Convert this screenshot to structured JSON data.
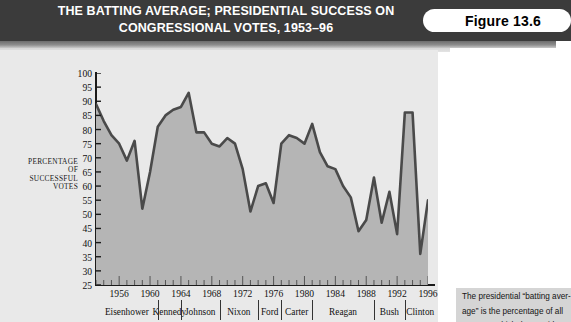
{
  "banner": {
    "title_line1": "THE BATTING AVERAGE; PRESIDENTIAL SUCCESS ON",
    "title_line2": "CONGRESSIONAL VOTES, 1953–96",
    "figure_label": "Figure 13.6",
    "background_color": "#3b3b3b",
    "text_color": "#ffffff"
  },
  "panel": {
    "background_color": "#e9e9e9"
  },
  "caption": {
    "line1": "The presidential “batting aver-",
    "line2": "age” is the percentage of all",
    "line3": "votes on which the president"
  },
  "axis": {
    "ylabel_line1": "PERCENTAGE",
    "ylabel_line2": "OF",
    "ylabel_line3": "SUCCESSFUL",
    "ylabel_line4": "VOTES"
  },
  "chart_data": {
    "type": "area",
    "title": "THE BATTING AVERAGE; PRESIDENTIAL SUCCESS ON CONGRESSIONAL VOTES, 1953–96",
    "xlabel": "",
    "ylabel": "PERCENTAGE OF SUCCESSFUL VOTES",
    "xlim": [
      1953,
      1996
    ],
    "ylim": [
      25,
      100
    ],
    "grid": false,
    "legend": "none",
    "line_color": "#4a4a4a",
    "fill_color": "#b5b5b5",
    "yticks": [
      100,
      95,
      90,
      85,
      80,
      75,
      70,
      65,
      60,
      55,
      50,
      45,
      40,
      35,
      30,
      25
    ],
    "xticks": [
      1956,
      1960,
      1964,
      1968,
      1972,
      1976,
      1980,
      1984,
      1988,
      1992,
      1996
    ],
    "xtick_minor_step": 1,
    "x": [
      1953,
      1954,
      1955,
      1956,
      1957,
      1958,
      1959,
      1960,
      1961,
      1962,
      1963,
      1964,
      1965,
      1966,
      1967,
      1968,
      1969,
      1970,
      1971,
      1972,
      1973,
      1974,
      1975,
      1976,
      1977,
      1978,
      1979,
      1980,
      1981,
      1982,
      1983,
      1984,
      1985,
      1986,
      1987,
      1988,
      1989,
      1990,
      1991,
      1992,
      1993,
      1994,
      1995,
      1996
    ],
    "values": [
      89,
      83,
      78,
      75,
      69,
      76,
      52,
      65,
      81,
      85,
      87,
      88,
      93,
      79,
      79,
      75,
      74,
      77,
      75,
      66,
      51,
      60,
      61,
      54,
      75,
      78,
      77,
      75,
      82,
      72,
      67,
      66,
      60,
      56,
      44,
      48,
      63,
      47,
      58,
      43,
      86,
      86,
      36,
      55
    ],
    "annotations": {
      "presidents": [
        {
          "name": "Eisenhower",
          "start": 1953,
          "end": 1961
        },
        {
          "name": "Kennedy",
          "start": 1961,
          "end": 1964
        },
        {
          "name": "Johnson",
          "start": 1964,
          "end": 1969
        },
        {
          "name": "Nixon",
          "start": 1969,
          "end": 1974
        },
        {
          "name": "Ford",
          "start": 1974,
          "end": 1977
        },
        {
          "name": "Carter",
          "start": 1977,
          "end": 1981
        },
        {
          "name": "Reagan",
          "start": 1981,
          "end": 1989
        },
        {
          "name": "Bush",
          "start": 1989,
          "end": 1993
        },
        {
          "name": "Clinton",
          "start": 1993,
          "end": 1997
        }
      ]
    }
  }
}
